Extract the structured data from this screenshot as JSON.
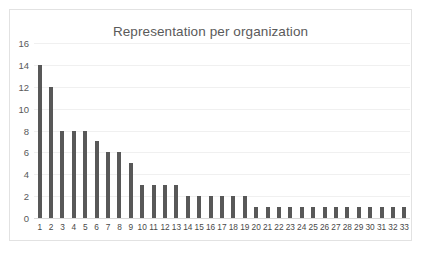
{
  "chart_data": {
    "type": "bar",
    "title": "Representation per organization",
    "xlabel": "",
    "ylabel": "",
    "ylim": [
      0,
      16
    ],
    "ytick_step": 2,
    "yticks": [
      "0",
      "2",
      "4",
      "6",
      "8",
      "10",
      "12",
      "14",
      "16"
    ],
    "grid": true,
    "legend": false,
    "legend_position": "none",
    "bar_color": "#585858",
    "gridline_color": "#f0f0f0",
    "axis_color": "#d9d9d9",
    "title_color": "#5a5a5a",
    "tick_label_color": "#595959",
    "plot_background": "#ffffff",
    "frame_border_color": "#e2e2e2",
    "categories": [
      "1",
      "2",
      "3",
      "4",
      "5",
      "6",
      "7",
      "8",
      "9",
      "10",
      "11",
      "12",
      "13",
      "14",
      "15",
      "16",
      "17",
      "18",
      "19",
      "20",
      "21",
      "22",
      "23",
      "24",
      "25",
      "26",
      "27",
      "28",
      "29",
      "30",
      "31",
      "32",
      "33"
    ],
    "values": [
      14,
      12,
      8,
      8,
      8,
      7,
      6,
      6,
      5,
      3,
      3,
      3,
      3,
      2,
      2,
      2,
      2,
      2,
      2,
      1,
      1,
      1,
      1,
      1,
      1,
      1,
      1,
      1,
      1,
      1,
      1,
      1,
      1
    ]
  }
}
